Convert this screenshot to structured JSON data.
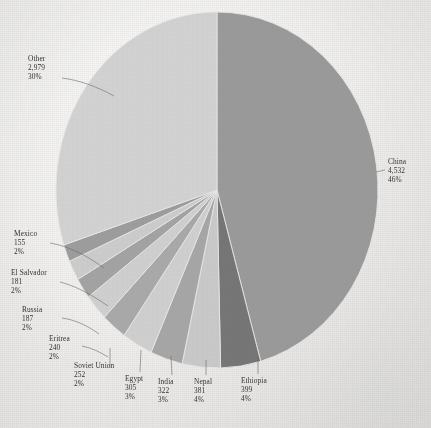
{
  "chart_data": {
    "type": "pie",
    "title": "",
    "subtitle": "",
    "xlabel": "",
    "ylabel": "",
    "legend_position": "none",
    "grid": false,
    "labels_show_value": true,
    "labels_show_percent": true,
    "total": 6883,
    "categories": [
      "China",
      "Ethiopia",
      "Nepal",
      "India",
      "Egypt",
      "Soviet Union",
      "Eritrea",
      "Russia",
      "El Salvador",
      "Mexico",
      "Other"
    ],
    "values": [
      4532,
      399,
      381,
      322,
      305,
      252,
      240,
      187,
      181,
      155,
      2979
    ],
    "percents": [
      46,
      4,
      4,
      3,
      3,
      2,
      2,
      2,
      2,
      2,
      30
    ],
    "value_labels": [
      "4,532",
      "399",
      "381",
      "322",
      "305",
      "252",
      "240",
      "187",
      "181",
      "155",
      "2,979"
    ],
    "percent_labels": [
      "46%",
      "4%",
      "4%",
      "3%",
      "3%",
      "2%",
      "2%",
      "2%",
      "2%",
      "2%",
      "30%"
    ],
    "slice_colors": [
      "#9a9a9a",
      "#767676",
      "#c9c9c9",
      "#a6a6a6",
      "#cfcfcf",
      "#a9a9a9",
      "#cfcfcf",
      "#a3a3a3",
      "#cccccc",
      "#9d9d9d",
      "#d2d2d2"
    ],
    "start_angle_deg": 0,
    "direction": "clockwise",
    "slices": [
      {
        "name": "China",
        "value": 4532,
        "value_label": "4,532",
        "percent": 46,
        "percent_label": "46%",
        "color": "#9a9a9a"
      },
      {
        "name": "Ethiopia",
        "value": 399,
        "value_label": "399",
        "percent": 4,
        "percent_label": "4%",
        "color": "#767676"
      },
      {
        "name": "Nepal",
        "value": 381,
        "value_label": "381",
        "percent": 4,
        "percent_label": "4%",
        "color": "#c9c9c9"
      },
      {
        "name": "India",
        "value": 322,
        "value_label": "322",
        "percent": 3,
        "percent_label": "3%",
        "color": "#a6a6a6"
      },
      {
        "name": "Egypt",
        "value": 305,
        "value_label": "305",
        "percent": 3,
        "percent_label": "3%",
        "color": "#cfcfcf"
      },
      {
        "name": "Soviet Union",
        "value": 252,
        "value_label": "252",
        "percent": 2,
        "percent_label": "2%",
        "color": "#a9a9a9"
      },
      {
        "name": "Eritrea",
        "value": 240,
        "value_label": "240",
        "percent": 2,
        "percent_label": "2%",
        "color": "#cfcfcf"
      },
      {
        "name": "Russia",
        "value": 187,
        "value_label": "187",
        "percent": 2,
        "percent_label": "2%",
        "color": "#a3a3a3"
      },
      {
        "name": "El Salvador",
        "value": 181,
        "value_label": "181",
        "percent": 2,
        "percent_label": "2%",
        "color": "#cccccc"
      },
      {
        "name": "Mexico",
        "value": 155,
        "value_label": "155",
        "percent": 2,
        "percent_label": "2%",
        "color": "#9d9d9d"
      },
      {
        "name": "Other",
        "value": 2979,
        "value_label": "2,979",
        "percent": 30,
        "percent_label": "30%",
        "color": "#d2d2d2"
      }
    ]
  },
  "labels": {
    "china": {
      "name": "China",
      "value": "4,532",
      "pct": "46%"
    },
    "ethiopia": {
      "name": "Ethiopia",
      "value": "399",
      "pct": "4%"
    },
    "nepal": {
      "name": "Nepal",
      "value": "381",
      "pct": "4%"
    },
    "india": {
      "name": "India",
      "value": "322",
      "pct": "3%"
    },
    "egypt": {
      "name": "Egypt",
      "value": "305",
      "pct": "3%"
    },
    "soviet_union": {
      "name": "Soviet Union",
      "value": "252",
      "pct": "2%"
    },
    "eritrea": {
      "name": "Eritrea",
      "value": "240",
      "pct": "2%"
    },
    "russia": {
      "name": "Russia",
      "value": "187",
      "pct": "2%"
    },
    "el_salvador": {
      "name": "El Salvador",
      "value": "181",
      "pct": "2%"
    },
    "mexico": {
      "name": "Mexico",
      "value": "155",
      "pct": "2%"
    },
    "other": {
      "name": "Other",
      "value": "2,979",
      "pct": "30%"
    }
  }
}
